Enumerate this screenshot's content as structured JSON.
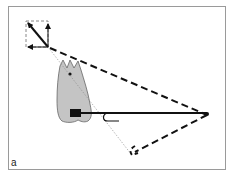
{
  "figure": {
    "panel_label": "a",
    "elements": [
      {
        "name": "force-parallelogram",
        "description": "dashed square with horizontal, vertical and diagonal resultant force arrows"
      },
      {
        "name": "tooth",
        "description": "gray molar tooth silhouette with center-of-resistance dot"
      },
      {
        "name": "bracket",
        "description": "black rectangular bracket on tooth"
      },
      {
        "name": "archwire",
        "description": "solid black wire extending from bracket to anchorage point on right"
      },
      {
        "name": "hook",
        "description": "J-shaped hook on wire"
      },
      {
        "name": "force-triangle",
        "description": "bold dashed lines from anchorage point to top-left and bottom"
      }
    ],
    "colors": {
      "tooth_fill": "#c4c4c4",
      "tooth_stroke": "#666666",
      "line": "#111111",
      "frame": "#9a9a9a",
      "dashed_square": "#888888"
    }
  }
}
